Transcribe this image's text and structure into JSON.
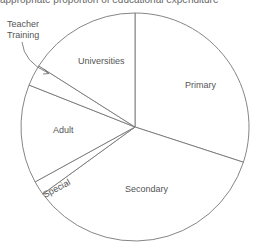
{
  "header": {
    "cut_text": "appropriate proportion of educational expenditure"
  },
  "chart_data": {
    "type": "pie",
    "title": "",
    "start_angle_deg": 90,
    "direction": "clockwise",
    "categories": [
      "Primary",
      "Secondary",
      "Special",
      "Adult",
      "Teacher Training",
      "Universities"
    ],
    "values": [
      30,
      35,
      2,
      14,
      3,
      16
    ],
    "colors": [
      "#ffffff",
      "#ffffff",
      "#ffffff",
      "#ffffff",
      "#ffffff",
      "#ffffff"
    ],
    "stroke": "#777777",
    "legend": "none",
    "annotations": [
      {
        "text": "Teacher Training",
        "points_to": "Teacher Training",
        "arrow": true
      }
    ]
  },
  "labels": {
    "primary": "Primary",
    "secondary": "Secondary",
    "special": "Special",
    "adult": "Adult",
    "teacher1": "Teacher",
    "teacher2": "Training",
    "universities": "Universities"
  }
}
